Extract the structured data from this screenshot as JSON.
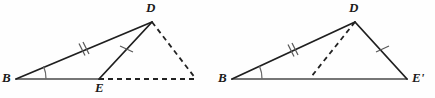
{
  "figure": {
    "background_color": "#fefefe",
    "stroke_color": "#1f1f1f",
    "base_stroke_color": "#4a4a4a",
    "dash_color": "#222222",
    "width": 435,
    "height": 98
  },
  "left_figure": {
    "name": "triangle-bde-with-extension",
    "vertices": {
      "B": {
        "x": 16,
        "y": 79,
        "label": "B"
      },
      "D": {
        "x": 152,
        "y": 22,
        "label": "D"
      },
      "E": {
        "x": 99,
        "y": 79,
        "label": "E"
      },
      "Eprime_image": {
        "x": 196,
        "y": 79,
        "label": ""
      }
    },
    "labels": [
      {
        "text": "B",
        "x": 2,
        "y": 72,
        "name": "vertex-label-b-left"
      },
      {
        "text": "D",
        "x": 147,
        "y": 2,
        "name": "vertex-label-d-left"
      },
      {
        "text": "E",
        "x": 95,
        "y": 82,
        "name": "vertex-label-e-left"
      }
    ],
    "solid_segments": [
      {
        "name": "segment-bd",
        "from": "B",
        "to": "D",
        "ticks": 2
      },
      {
        "name": "segment-de",
        "from": "D",
        "to": "E",
        "ticks": 1
      },
      {
        "name": "segment-be",
        "from": "B",
        "to": "E",
        "ticks": 0
      }
    ],
    "dashed_segments": [
      {
        "name": "dashed-segment-d-eprime",
        "from": "D",
        "to": "Eprime_image"
      },
      {
        "name": "dashed-segment-e-eprime",
        "from": "E",
        "to": "Eprime_image"
      }
    ],
    "angle_mark": {
      "name": "angle-arc-b-left",
      "at": "B",
      "radius": 30,
      "marks": 1
    }
  },
  "right_figure": {
    "name": "triangle-bde-prime",
    "vertices": {
      "B": {
        "x": 232,
        "y": 79,
        "label": "B"
      },
      "D": {
        "x": 355,
        "y": 22,
        "label": "D"
      },
      "Eprime": {
        "x": 407,
        "y": 79,
        "label": "E'"
      }
    },
    "labels": [
      {
        "text": "B",
        "x": 218,
        "y": 72,
        "name": "vertex-label-b-right"
      },
      {
        "text": "D",
        "x": 350,
        "y": 2,
        "name": "vertex-label-d-right"
      },
      {
        "text": "E'",
        "x": 412,
        "y": 72,
        "name": "vertex-label-eprime-right"
      }
    ],
    "solid_segments": [
      {
        "name": "segment-bd-right",
        "from": "B",
        "to": "D",
        "ticks": 2
      },
      {
        "name": "segment-d-eprime-right",
        "from": "D",
        "to": "Eprime",
        "ticks": 1
      },
      {
        "name": "segment-b-eprime-right",
        "from": "B",
        "to": "Eprime",
        "ticks": 0
      }
    ],
    "dashed_segments": [
      {
        "name": "dashed-segment-d-interior",
        "from": "D",
        "to": {
          "x": 311,
          "y": 77
        }
      }
    ],
    "angle_mark": {
      "name": "angle-arc-b-right",
      "at": "B",
      "radius": 30,
      "marks": 1
    }
  },
  "tick_marks": {
    "left_bd": {
      "name": "tick-double-bd-left",
      "x": 83,
      "y": 50,
      "count": 2
    },
    "left_de": {
      "name": "tick-single-de-left",
      "x": 126,
      "y": 49,
      "count": 1
    },
    "right_bd": {
      "name": "tick-double-bd-right",
      "x": 292,
      "y": 51,
      "count": 2
    },
    "right_de": {
      "name": "tick-single-de-right",
      "x": 382,
      "y": 49,
      "count": 1
    }
  }
}
